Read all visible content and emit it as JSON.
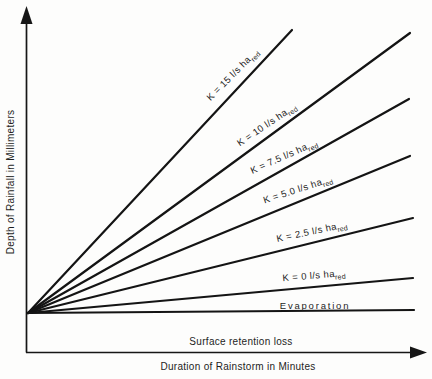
{
  "figure": {
    "background": "#fdfdfc",
    "line_color": "#141414",
    "text_color": "#1d1d1d"
  },
  "axes": {
    "x_label": "Duration of Rainstorm in Minutes",
    "y_label": "Depth of Rainfall in Millimeters"
  },
  "annotations": {
    "surface_retention": {
      "text": "Surface retention loss",
      "x_px": 241,
      "y_px": 341
    }
  },
  "chart_data": {
    "type": "line",
    "title": "",
    "xlabel": "Duration of Rainstorm in Minutes",
    "ylabel": "Depth of Rainfall in Millimeters",
    "axes_quantitative": false,
    "grid": false,
    "origin_px": {
      "x": 28,
      "y": 313
    },
    "series": [
      {
        "name": "K = 15 l/s ha_red",
        "k_value": 15,
        "label": "K = 15 l/s ha",
        "label_sub": "red",
        "end_px": {
          "x": 292,
          "y": 30
        },
        "label_px": {
          "x": 233,
          "y": 75
        },
        "label_angle_deg": -45,
        "letter_spacing": 0.4
      },
      {
        "name": "K = 10 l/s ha_red",
        "k_value": 10,
        "label": "K = 10 l/s ha",
        "label_sub": "red",
        "end_px": {
          "x": 410,
          "y": 33
        },
        "label_px": {
          "x": 267,
          "y": 125
        },
        "label_angle_deg": -34,
        "letter_spacing": 0.4
      },
      {
        "name": "K = 7.5 l/s ha_red",
        "k_value": 7.5,
        "label": "K = 7.5 l/s ha",
        "label_sub": "red",
        "end_px": {
          "x": 409,
          "y": 99
        },
        "label_px": {
          "x": 284,
          "y": 157
        },
        "label_angle_deg": -24,
        "letter_spacing": 0.4
      },
      {
        "name": "K = 5.0 l/s ha_red",
        "k_value": 5.0,
        "label": "K = 5.0 l/s ha",
        "label_sub": "red",
        "end_px": {
          "x": 410,
          "y": 156
        },
        "label_px": {
          "x": 298,
          "y": 190
        },
        "label_angle_deg": -18,
        "letter_spacing": 0.4
      },
      {
        "name": "K = 2.5 l/s ha_red",
        "k_value": 2.5,
        "label": "K = 2.5 l/s ha",
        "label_sub": "red",
        "end_px": {
          "x": 413,
          "y": 218
        },
        "label_angle_deg": -12,
        "letter_spacing": 0.4,
        "label_px": {
          "x": 312,
          "y": 232
        }
      },
      {
        "name": "K = 0 l/s ha_red",
        "k_value": 0,
        "label": "K = 0 l/s ha",
        "label_sub": "red",
        "end_px": {
          "x": 413,
          "y": 278
        },
        "label_px": {
          "x": 314,
          "y": 276
        },
        "label_angle_deg": -5,
        "letter_spacing": 0.4
      },
      {
        "name": "Evaporation",
        "label": "Evaporation",
        "label_sub": "",
        "end_px": {
          "x": 414,
          "y": 310
        },
        "label_px": {
          "x": 315,
          "y": 305
        },
        "label_angle_deg": 0,
        "letter_spacing": 1.8
      }
    ],
    "annotations": [
      {
        "text": "Surface retention loss",
        "x_px": 241,
        "y_px": 341
      }
    ]
  }
}
